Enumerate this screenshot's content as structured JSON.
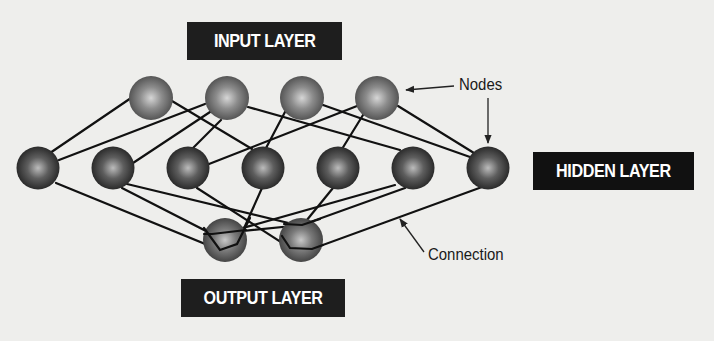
{
  "labels": {
    "input_layer": "INPUT LAYER",
    "hidden_layer": "HIDDEN LAYER",
    "output_layer": "OUTPUT LAYER",
    "nodes": "Nodes",
    "connection": "Connection"
  },
  "colors": {
    "background": "#eeeeec",
    "label_box": "#1e1e1e",
    "label_text": "#ffffff",
    "line": "#111111",
    "input_node": "#7a7a7a",
    "hidden_node": "#4a4a4a",
    "output_node": "#6a6a6a"
  },
  "nodes": {
    "input": [
      {
        "x": 151,
        "y": 98
      },
      {
        "x": 227,
        "y": 98
      },
      {
        "x": 302,
        "y": 98
      },
      {
        "x": 377,
        "y": 98
      }
    ],
    "hidden": [
      {
        "x": 38,
        "y": 168
      },
      {
        "x": 113,
        "y": 168
      },
      {
        "x": 188,
        "y": 168
      },
      {
        "x": 263,
        "y": 168
      },
      {
        "x": 338,
        "y": 168
      },
      {
        "x": 413,
        "y": 168
      },
      {
        "x": 488,
        "y": 168
      }
    ],
    "output": [
      {
        "x": 225,
        "y": 240
      },
      {
        "x": 301,
        "y": 240
      }
    ]
  }
}
